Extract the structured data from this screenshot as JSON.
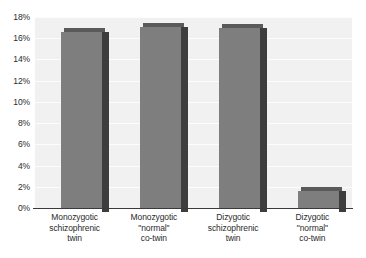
{
  "chart_data": {
    "type": "bar",
    "title": "",
    "subtitle": "",
    "xlabel": "",
    "ylabel": "",
    "ylim": [
      0,
      18
    ],
    "ytick_labels": [
      "0%",
      "2%",
      "4%",
      "6%",
      "8%",
      "10%",
      "12%",
      "14%",
      "16%",
      "18%"
    ],
    "ytick_values": [
      0,
      2,
      4,
      6,
      8,
      10,
      12,
      14,
      16,
      18
    ],
    "grid": true,
    "legend": "none",
    "value_suffix": "%",
    "categories": [
      "Monozygotic schizophrenic twin",
      "Monozygotic \"normal\" co-twin",
      "Dizygotic schizophrenic twin",
      "Dizygotic \"normal\" co-twin"
    ],
    "category_lines": [
      [
        "Monozygotic",
        "schizophrenic",
        "twin"
      ],
      [
        "Monozygotic",
        "\"normal\"",
        "co-twin"
      ],
      [
        "Dizygotic",
        "schizophrenic",
        "twin"
      ],
      [
        "Dizygotic",
        "\"normal\"",
        "co-twin"
      ]
    ],
    "values": [
      16.6,
      17.1,
      17.0,
      1.6
    ],
    "colors": {
      "bar_face": "#7e7e7e",
      "bar_side": "#3d3d3d",
      "bar_top": "#5a5a5a",
      "plot_background": "#f1f1f1",
      "gridline": "#fcfcfc",
      "axis_line": "#3a3a3a",
      "text": "#2b2b2b",
      "page_background": "#ffffff"
    }
  }
}
